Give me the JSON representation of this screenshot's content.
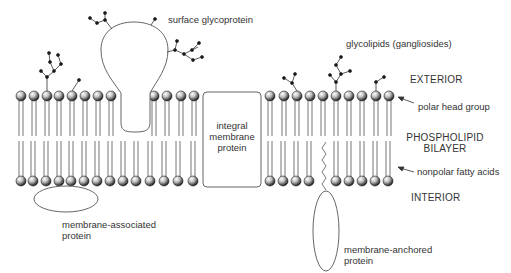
{
  "labels": {
    "surface_glycoprotein": "surface glycoprotein",
    "glycolipids": "glycolipids (gangliosides)",
    "exterior": "EXTERIOR",
    "polar_head_group": "polar head group",
    "phospholipid_line1": "PHOSPHOLIPID",
    "phospholipid_line2": "BILAYER",
    "nonpolar_fatty_acids": "nonpolar fatty acids",
    "interior": "INTERIOR",
    "integral_line1": "integral",
    "integral_line2": "membrane",
    "integral_line3": "protein",
    "assoc_line1": "membrane-associated",
    "assoc_line2": "protein",
    "anchored_line1": "membrane-anchored",
    "anchored_line2": "protein"
  },
  "colors": {
    "stroke": "#555555",
    "text": "#333333",
    "head_light": "#f4f4f4",
    "head_dark": "#222222"
  },
  "bilayer": {
    "top_heads_y": 96,
    "bottom_heads_y": 181,
    "top_heads_x": [
      21,
      34,
      47,
      59,
      72,
      85,
      98,
      111,
      154,
      167,
      181,
      194,
      270,
      284,
      297,
      310,
      323,
      336,
      349,
      362,
      376,
      389
    ],
    "bottom_heads_x": [
      21,
      33,
      46,
      59,
      71,
      84,
      97,
      110,
      123,
      136,
      150,
      164,
      178,
      193,
      270,
      283,
      296,
      309,
      336,
      349,
      362,
      375,
      388
    ]
  }
}
